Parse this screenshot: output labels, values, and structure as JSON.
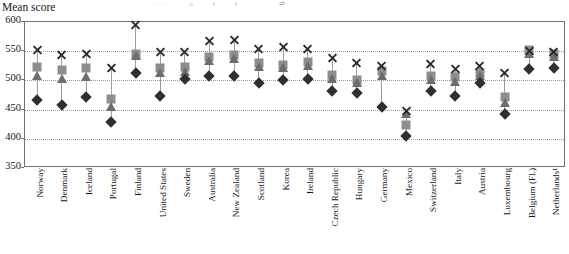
{
  "axis_title": "Mean score",
  "legend_fragment": [
    "·····",
    "o",
    "I",
    "I",
    "·",
    "⇄"
  ],
  "chart_data": {
    "type": "scatter",
    "title": "Mean score",
    "xlabel": "",
    "ylabel": "Mean score",
    "ylim": [
      350,
      600
    ],
    "yticks": [
      350,
      400,
      450,
      500,
      550,
      600
    ],
    "grid": true,
    "legend_position": "above-cropped",
    "categories": [
      "Norway",
      "Denmark",
      "Iceland",
      "Portugal",
      "Finland",
      "United States",
      "Sweden",
      "Australia",
      "New Zealand",
      "Scotland",
      "Korea",
      "Ireland",
      "Czech Republic",
      "Hungary",
      "Germany",
      "Mexico",
      "Switzerland",
      "Italy",
      "Austria",
      "Luxembourg",
      "Belgium (Fl.)",
      "Netherlands¹"
    ],
    "series": [
      {
        "name": "x-marker",
        "marker": "x",
        "color": "#2a2a2a",
        "values": [
          552,
          543,
          545,
          521,
          595,
          548,
          548,
          568,
          570,
          553,
          557,
          554,
          539,
          530,
          525,
          447,
          528,
          519,
          524,
          513,
          551,
          549
        ]
      },
      {
        "name": "square-marker",
        "marker": "square",
        "color": "#8d8d8d",
        "values": [
          523,
          518,
          521,
          468,
          546,
          522,
          523,
          540,
          543,
          530,
          527,
          531,
          510,
          501,
          516,
          424,
          507,
          505,
          513,
          472,
          552,
          546
        ]
      },
      {
        "name": "triangle-marker",
        "marker": "triangle",
        "color": "#6d6d6d",
        "values": [
          508,
          503,
          505,
          455,
          542,
          512,
          514,
          534,
          537,
          523,
          521,
          524,
          502,
          496,
          508,
          442,
          500,
          498,
          507,
          461,
          546,
          540
        ]
      },
      {
        "name": "diamond-marker",
        "marker": "diamond",
        "color": "#2f2f2f",
        "values": [
          466,
          458,
          471,
          428,
          512,
          474,
          503,
          507,
          508,
          495,
          500,
          503,
          482,
          479,
          455,
          404,
          482,
          474,
          496,
          443,
          520,
          521
        ]
      }
    ]
  }
}
